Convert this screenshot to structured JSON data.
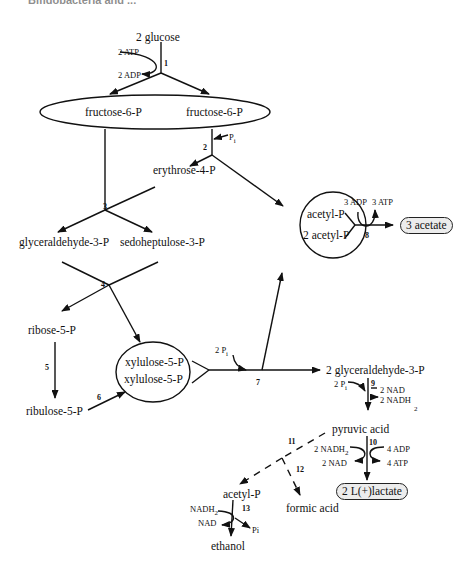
{
  "header": {
    "cropped_title": "Bifidobacteria and ..."
  },
  "diagram": {
    "nodes": {
      "glucose": "2 glucose",
      "fructose_a": "fructose-6-P",
      "fructose_b": "fructose-6-P",
      "erythrose": "erythrose-4-P",
      "glyceraldehyde_3p": "glyceraldehyde-3-P",
      "sedoheptulose": "sedoheptulose-3-P",
      "ribose": "ribose-5-P",
      "ribulose": "ribulose-5-P",
      "xylulose_a": "xylulose-5-P",
      "xylulose_b": "xylulose-5-P",
      "acetyl_p_a": "acetyl-P",
      "acetyl_p_b": "2 acetyl-P",
      "acetate": "3 acetate",
      "glyceraldehyde_2": "2 glyceraldehyde-3-P",
      "pyruvic": "pyruvic acid",
      "lactate": "2 L(+)lactate",
      "acetyl_p_c": "acetyl-P",
      "formic": "formic acid",
      "ethanol": "ethanol"
    },
    "cofactors": {
      "atp_in": "2 ATP",
      "adp_out": "2 ADP",
      "pi_2": "P",
      "pi_2_sub": "i",
      "adp_8": "3 ADP",
      "atp_8": "3 ATP",
      "pi_7": "2 P",
      "pi_7_sub": "i",
      "pi_9": "2 P",
      "pi_9_sub": "i",
      "nad_9": "2 NAD",
      "nadh_9": "2 NADH",
      "nadh_9_sub": "2",
      "nadh_10": "2 NADH",
      "nadh_10_sub": "2",
      "nad_10": "2 NAD",
      "adp_10": "4 ADP",
      "atp_10": "4 ATP",
      "nadh_13": "NADH",
      "nadh_13_sub": "2",
      "nad_13": "NAD",
      "pi_13": "Pi"
    },
    "steps": [
      "1",
      "2",
      "3",
      "4",
      "5",
      "6",
      "7",
      "8",
      "9",
      "10",
      "11",
      "12",
      "13"
    ]
  }
}
